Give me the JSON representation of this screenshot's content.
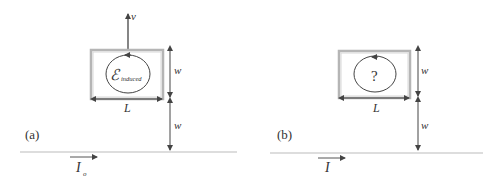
{
  "panels": [
    {
      "id": "a",
      "label": "(a)",
      "velocity_label": "v",
      "loop_emf_symbol": "ℰ",
      "loop_emf_subscript": "induced",
      "width_label": "L",
      "height_label_top": "w",
      "height_label_bottom": "w",
      "current_symbol": "I",
      "current_subscript": "o"
    },
    {
      "id": "b",
      "label": "(b)",
      "loop_emf_symbol": "?",
      "width_label": "L",
      "height_label_top": "w",
      "height_label_bottom": "w",
      "current_symbol": "I"
    }
  ],
  "colors": {
    "line": "#444444",
    "loop_outer": "#aaaaaa",
    "ground_line": "#bbbbbb",
    "text": "#333333"
  }
}
